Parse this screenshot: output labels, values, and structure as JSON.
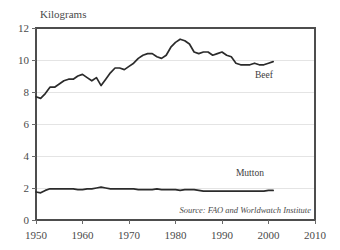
{
  "chart_data": {
    "type": "line",
    "title": "",
    "ylabel": "Kilograms",
    "xlabel": "",
    "ylim": [
      0,
      12
    ],
    "xlim": [
      1950,
      2010
    ],
    "yticks": [
      "0",
      "2",
      "4",
      "6",
      "8",
      "10",
      "12"
    ],
    "ytick_values": [
      0,
      2,
      4,
      6,
      8,
      10,
      12
    ],
    "xticks": [
      "1950",
      "1960",
      "1970",
      "1980",
      "1990",
      "2000",
      "2010"
    ],
    "xtick_values": [
      1950,
      1960,
      1970,
      1980,
      1990,
      2000,
      2010
    ],
    "grid": "horizontal",
    "legend_position": "inline-labels",
    "annotation": "Source: FAO and Worldwatch Institute",
    "series": [
      {
        "name": "Beef",
        "label": "Beef",
        "color": "#2b2b2b",
        "x": [
          1950,
          1951,
          1952,
          1953,
          1954,
          1955,
          1956,
          1957,
          1958,
          1959,
          1960,
          1961,
          1962,
          1963,
          1964,
          1965,
          1966,
          1967,
          1968,
          1969,
          1970,
          1971,
          1972,
          1973,
          1974,
          1975,
          1976,
          1977,
          1978,
          1979,
          1980,
          1981,
          1982,
          1983,
          1984,
          1985,
          1986,
          1987,
          1988,
          1989,
          1990,
          1991,
          1992,
          1993,
          1994,
          1995,
          1996,
          1997,
          1998,
          1999,
          2000,
          2001
        ],
        "values": [
          7.7,
          7.6,
          7.9,
          8.3,
          8.3,
          8.5,
          8.7,
          8.8,
          8.8,
          9.0,
          9.1,
          8.9,
          8.7,
          8.9,
          8.4,
          8.8,
          9.2,
          9.5,
          9.5,
          9.4,
          9.6,
          9.8,
          10.1,
          10.3,
          10.4,
          10.4,
          10.2,
          10.1,
          10.3,
          10.8,
          11.1,
          11.3,
          11.2,
          11.0,
          10.5,
          10.4,
          10.5,
          10.5,
          10.3,
          10.4,
          10.5,
          10.3,
          10.2,
          9.8,
          9.7,
          9.7,
          9.7,
          9.8,
          9.7,
          9.7,
          9.8,
          9.9
        ]
      },
      {
        "name": "Mutton",
        "label": "Mutton",
        "color": "#2b2b2b",
        "x": [
          1950,
          1951,
          1952,
          1953,
          1954,
          1955,
          1956,
          1957,
          1958,
          1959,
          1960,
          1961,
          1962,
          1963,
          1964,
          1965,
          1966,
          1967,
          1968,
          1969,
          1970,
          1971,
          1972,
          1973,
          1974,
          1975,
          1976,
          1977,
          1978,
          1979,
          1980,
          1981,
          1982,
          1983,
          1984,
          1985,
          1986,
          1987,
          1988,
          1989,
          1990,
          1991,
          1992,
          1993,
          1994,
          1995,
          1996,
          1997,
          1998,
          1999,
          2000,
          2001
        ],
        "values": [
          1.75,
          1.7,
          1.85,
          1.95,
          1.95,
          1.95,
          1.95,
          1.95,
          1.95,
          1.9,
          1.9,
          1.95,
          1.95,
          2.0,
          2.05,
          2.0,
          1.95,
          1.95,
          1.95,
          1.95,
          1.95,
          1.95,
          1.9,
          1.9,
          1.9,
          1.9,
          1.95,
          1.9,
          1.9,
          1.9,
          1.9,
          1.85,
          1.9,
          1.9,
          1.9,
          1.85,
          1.8,
          1.8,
          1.8,
          1.8,
          1.8,
          1.8,
          1.8,
          1.8,
          1.8,
          1.8,
          1.8,
          1.8,
          1.8,
          1.8,
          1.85,
          1.85
        ]
      }
    ],
    "series_label_positions": [
      {
        "name": "Beef",
        "x": 1999,
        "y": 8.85
      },
      {
        "name": "Mutton",
        "x": 1996,
        "y": 2.75
      }
    ]
  }
}
